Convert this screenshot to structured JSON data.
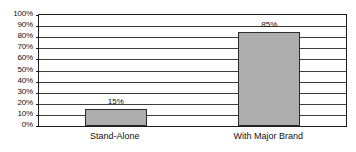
{
  "chart_data": {
    "type": "bar",
    "title": "",
    "subtitle": "",
    "xlabel": "",
    "ylabel": "",
    "categories": [
      "Stand-Alone",
      "With Major Brand"
    ],
    "values": [
      15,
      85
    ],
    "value_labels": [
      "15%",
      "85%"
    ],
    "ylim": [
      0,
      100
    ],
    "ytick_values": [
      0,
      10,
      20,
      30,
      40,
      50,
      60,
      70,
      80,
      90,
      100
    ],
    "ytick_labels": [
      "0%",
      "10%",
      "20%",
      "30%",
      "40%",
      "50%",
      "60%",
      "70%",
      "80%",
      "90%",
      "100%"
    ],
    "grid": true,
    "grid_axis": "y",
    "legend": false,
    "legend_position": "none",
    "bar_fill_color": "#adadad",
    "bar_border_color": "#2b2b2b",
    "gridline_color": "#3d3d3d",
    "frame_color": "#1c1c1c",
    "background_color": "#ffffff"
  }
}
